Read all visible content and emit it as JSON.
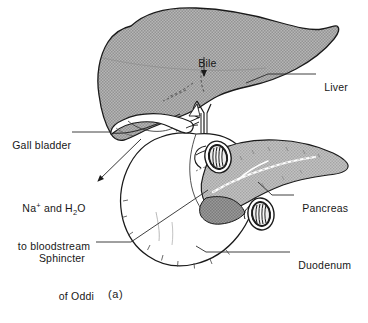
{
  "figure": {
    "caption": "(a)",
    "palette": {
      "liver_fill": "#a9a9a9",
      "pancreas_fill": "#b4b4b4",
      "organ_white": "#ffffff",
      "line": "#1a1a1a",
      "leader_line": "#333333",
      "background": "#ffffff"
    }
  },
  "labels": {
    "bile": {
      "text": "Bile",
      "x": 192,
      "y": 50
    },
    "liver": {
      "text": "Liver",
      "x": 318,
      "y": 70
    },
    "gall_bladder": {
      "text": "Gall bladder",
      "x": 8,
      "y": 128
    },
    "sodium_water": {
      "line1_pre": "Na",
      "line1_sup": "+",
      "line1_mid": " and H",
      "line1_sub": "2",
      "line1_post": "O",
      "line2": "to bloodstream",
      "x": 10,
      "y": 178
    },
    "pancreas": {
      "text": "Pancreas",
      "x": 296,
      "y": 191
    },
    "sphincter_of_oddi": {
      "line1": "Sphincter",
      "line2": "of Oddi",
      "x": 34,
      "y": 229
    },
    "duodenum": {
      "text": "Duodenum",
      "x": 292,
      "y": 248
    }
  },
  "structures": {
    "liver": "liver-shape",
    "gall_bladder": "gall-bladder-shape",
    "bile_duct": "bile-duct-shape",
    "pancreas": "pancreas-shape",
    "duodenum": "duodenum-shape",
    "cut_duct_upper": "cut-duct-oval-upper",
    "cut_duct_lower": "cut-duct-oval-lower",
    "pancreatic_duct": "pancreatic-duct-line"
  }
}
